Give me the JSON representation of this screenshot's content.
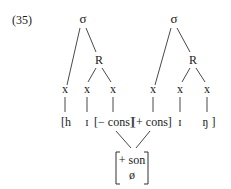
{
  "example_number": "(35)",
  "trees": [
    {
      "root": "σ",
      "rhyme": "R",
      "timing_slots": [
        "x",
        "x",
        "x"
      ],
      "segments": [
        "[h",
        "ɪ",
        "[− cons]"
      ]
    },
    {
      "root": "σ",
      "rhyme": "R",
      "timing_slots": [
        "x",
        "x",
        "x"
      ],
      "segments": [
        "[+ cons]",
        "ɪ",
        "ŋ ]"
      ]
    }
  ],
  "shared_node": {
    "features": [
      "+ son",
      "ø"
    ]
  },
  "colors": {
    "ink": "#1a1a1a",
    "background": "#ffffff"
  }
}
